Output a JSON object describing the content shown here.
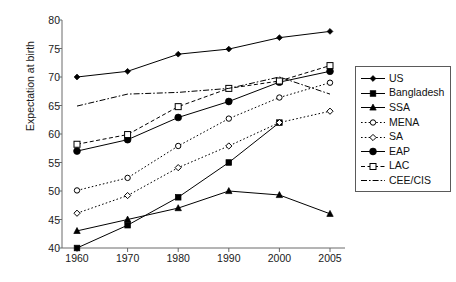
{
  "chart_data": {
    "type": "line",
    "title": "",
    "xlabel": "",
    "ylabel": "Expectation at birth",
    "categories": [
      "1960",
      "1970",
      "1980",
      "1990",
      "2000",
      "2005"
    ],
    "x": [
      1960,
      1970,
      1980,
      1990,
      2000,
      2005
    ],
    "ylim": [
      40,
      80
    ],
    "yticks": [
      "40",
      "45",
      "50",
      "55",
      "60",
      "65",
      "70",
      "75",
      "80"
    ],
    "ytick_values": [
      40,
      45,
      50,
      55,
      60,
      65,
      70,
      75,
      80
    ],
    "xticks": [
      "1960",
      "1970",
      "1980",
      "1990",
      "2000",
      "2005"
    ],
    "grid": false,
    "legend_position": "right-outside",
    "series": [
      {
        "name": "US",
        "marker": "small-filled-diamond",
        "line": "solid",
        "values": [
          70.0,
          71.0,
          74.0,
          74.9,
          76.9,
          78.0
        ]
      },
      {
        "name": "Bangladesh",
        "marker": "filled-square",
        "line": "solid",
        "values": [
          40.0,
          44.0,
          48.9,
          55.0,
          62.0,
          null
        ]
      },
      {
        "name": "SSA",
        "marker": "filled-triangle",
        "line": "solid",
        "values": [
          43.0,
          45.0,
          47.0,
          50.0,
          49.3,
          46.0
        ]
      },
      {
        "name": "MENA",
        "marker": "open-circle",
        "line": "dotted",
        "values": [
          50.1,
          52.3,
          57.9,
          62.7,
          66.4,
          69.0
        ]
      },
      {
        "name": "SA",
        "marker": "open-diamond",
        "line": "dotted",
        "values": [
          46.1,
          49.2,
          54.1,
          57.9,
          62.0,
          64.0
        ]
      },
      {
        "name": "EAP",
        "marker": "large-filled-circle",
        "line": "solid",
        "values": [
          57.0,
          59.0,
          62.9,
          65.7,
          69.1,
          71.0
        ]
      },
      {
        "name": "LAC",
        "marker": "open-square",
        "line": "dashed",
        "values": [
          58.2,
          59.9,
          64.8,
          68.0,
          69.3,
          72.0
        ]
      },
      {
        "name": "CEE/CIS",
        "marker": "none",
        "line": "dash-dot",
        "values": [
          64.9,
          67.0,
          67.3,
          68.0,
          70.0,
          67.0
        ]
      }
    ]
  },
  "legend": {
    "items": [
      {
        "label": "US"
      },
      {
        "label": "Bangladesh"
      },
      {
        "label": "SSA"
      },
      {
        "label": "MENA"
      },
      {
        "label": "SA"
      },
      {
        "label": "EAP"
      },
      {
        "label": "LAC"
      },
      {
        "label": "CEE/CIS"
      }
    ]
  }
}
